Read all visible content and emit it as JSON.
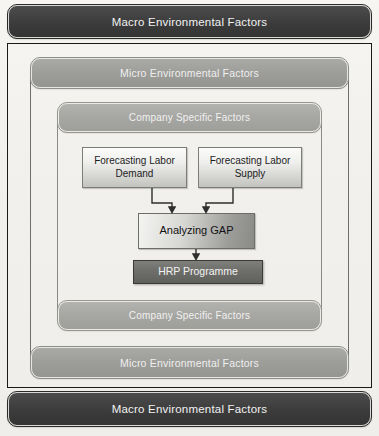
{
  "diagram": {
    "layers": {
      "macro_top_label": "Macro Environmental Factors",
      "micro_top_label": "Micro Environmental Factors",
      "company_top_label": "Company Specific Factors",
      "company_bottom_label": "Company Specific Factors",
      "micro_bottom_label": "Micro Environmental Factors",
      "macro_bottom_label": "Macro Environmental Factors"
    },
    "nodes": {
      "forecast_demand_line1": "Forecasting Labor",
      "forecast_demand_line2": "Demand",
      "forecast_supply_line1": "Forecasting Labor",
      "forecast_supply_line2": "Supply",
      "analyzing_gap": "Analyzing GAP",
      "hrp_programme": "HRP Programme"
    },
    "colors": {
      "macro_bar": "#3c3c3c",
      "micro_bar": "#9d9d9a",
      "company_bar": "#a6a6a3",
      "forecast_box": "#e6e6e3",
      "gap_box": "#b5b5b2",
      "hrp_box": "#6e6e6b",
      "outer_border": "#1a1a1a",
      "page_background": "#f1f0ec",
      "connector": "#333333"
    }
  }
}
